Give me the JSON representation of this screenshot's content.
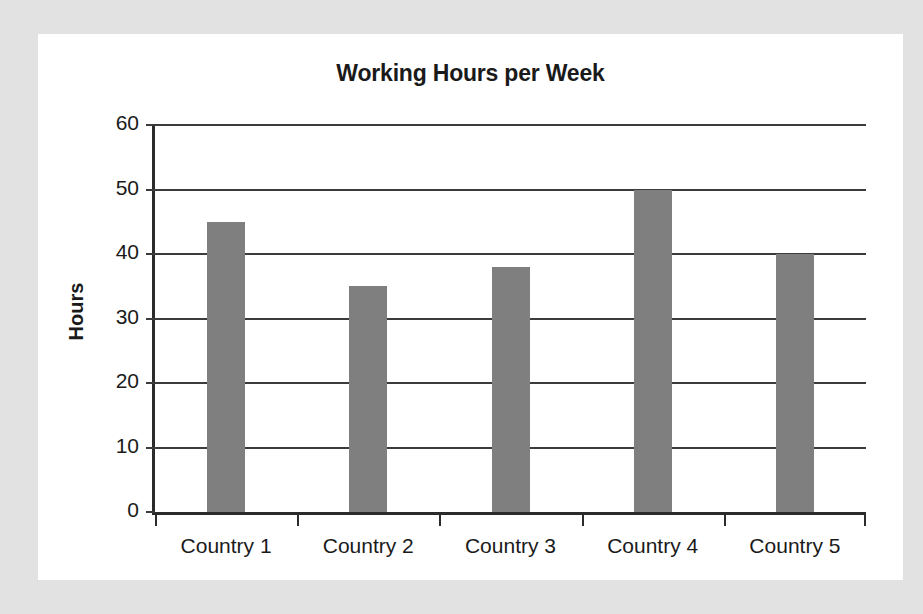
{
  "chart_data": {
    "type": "bar",
    "title": "Working Hours per Week",
    "xlabel": "",
    "ylabel": "Hours",
    "categories": [
      "Country 1",
      "Country 2",
      "Country 3",
      "Country 4",
      "Country 5"
    ],
    "values": [
      45,
      35,
      38,
      50,
      40
    ],
    "ylim": [
      0,
      60
    ],
    "ytick_step": 10,
    "yticks": [
      0,
      10,
      20,
      30,
      40,
      50,
      60
    ],
    "ytick_labels": [
      "0",
      "10",
      "20",
      "30",
      "40",
      "50",
      "60"
    ],
    "grid": "horizontal",
    "legend": "none",
    "series": [
      {
        "name": "Hours",
        "values": [
          45,
          35,
          38,
          50,
          40
        ]
      }
    ],
    "colors": {
      "bar_fill": "#7f7f7f",
      "axis": "#2b2b2b",
      "gridline": "#3b3b3b",
      "text": "#1a1a1a",
      "plot_background": "#ffffff",
      "figure_background": "#e2e2e2"
    }
  }
}
